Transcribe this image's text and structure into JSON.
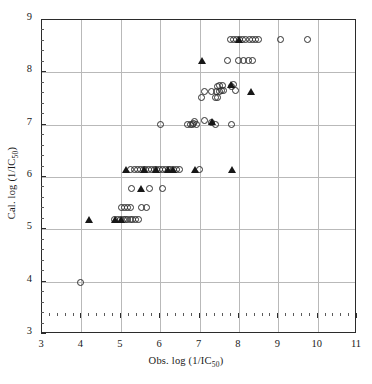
{
  "chart_data": {
    "type": "scatter",
    "title": "",
    "xlabel": "Obs. log (1/IC50)",
    "ylabel": "Cal. log (1/IC50)",
    "xlabel_main": "Obs. log (1/IC",
    "xlabel_sub": "50",
    "xlabel_tail": ")",
    "ylabel_main": "Cal. log (1/IC",
    "ylabel_sub": "50",
    "ylabel_tail": ")",
    "xlim": [
      3,
      11
    ],
    "ylim": [
      3,
      9
    ],
    "xticks": [
      3,
      4,
      5,
      6,
      7,
      8,
      9,
      10,
      11
    ],
    "yticks": [
      3,
      4,
      5,
      6,
      7,
      8,
      9
    ],
    "xtick_labels": [
      "3",
      "4",
      "5",
      "6",
      "7",
      "8",
      "9",
      "10",
      "11"
    ],
    "ytick_labels": [
      "3",
      "4",
      "5",
      "6",
      "7",
      "8",
      "9"
    ],
    "grid": true,
    "legend": "none",
    "minor_ticks_per_interval": 5,
    "series": [
      {
        "name": "training-set",
        "marker": "open-circle",
        "color": "#2f2f2f",
        "points": [
          [
            3.98,
            3.99
          ],
          [
            4.83,
            5.19
          ],
          [
            4.92,
            5.19
          ],
          [
            5.0,
            5.19
          ],
          [
            5.07,
            5.19
          ],
          [
            5.12,
            5.19
          ],
          [
            5.18,
            5.19
          ],
          [
            5.24,
            5.19
          ],
          [
            5.3,
            5.19
          ],
          [
            5.38,
            5.19
          ],
          [
            5.46,
            5.19
          ],
          [
            5.02,
            5.41
          ],
          [
            5.09,
            5.41
          ],
          [
            5.16,
            5.41
          ],
          [
            5.24,
            5.41
          ],
          [
            5.52,
            5.41
          ],
          [
            5.66,
            5.41
          ],
          [
            5.27,
            5.78
          ],
          [
            5.72,
            5.78
          ],
          [
            6.05,
            5.78
          ],
          [
            5.24,
            6.15
          ],
          [
            5.34,
            6.15
          ],
          [
            5.43,
            6.15
          ],
          [
            5.5,
            6.15
          ],
          [
            5.57,
            6.15
          ],
          [
            5.64,
            6.15
          ],
          [
            5.71,
            6.15
          ],
          [
            5.78,
            6.15
          ],
          [
            5.85,
            6.15
          ],
          [
            5.92,
            6.15
          ],
          [
            5.99,
            6.15
          ],
          [
            6.06,
            6.15
          ],
          [
            6.13,
            6.15
          ],
          [
            6.2,
            6.15
          ],
          [
            6.27,
            6.15
          ],
          [
            6.34,
            6.15
          ],
          [
            6.41,
            6.15
          ],
          [
            6.48,
            6.15
          ],
          [
            7.0,
            6.15
          ],
          [
            6.02,
            7.0
          ],
          [
            6.7,
            7.0
          ],
          [
            6.76,
            7.0
          ],
          [
            6.82,
            7.0
          ],
          [
            6.86,
            7.03
          ],
          [
            6.88,
            7.06
          ],
          [
            6.92,
            7.0
          ],
          [
            7.12,
            7.08
          ],
          [
            7.3,
            7.05
          ],
          [
            7.4,
            7.0
          ],
          [
            7.82,
            7.0
          ],
          [
            7.05,
            7.51
          ],
          [
            7.12,
            7.64
          ],
          [
            7.3,
            7.64
          ],
          [
            7.4,
            7.52
          ],
          [
            7.46,
            7.52
          ],
          [
            7.42,
            7.64
          ],
          [
            7.5,
            7.64
          ],
          [
            7.46,
            7.72
          ],
          [
            7.52,
            7.74
          ],
          [
            7.58,
            7.74
          ],
          [
            7.56,
            7.66
          ],
          [
            7.62,
            7.66
          ],
          [
            7.8,
            7.72
          ],
          [
            7.86,
            7.76
          ],
          [
            7.92,
            7.66
          ],
          [
            7.72,
            8.22
          ],
          [
            7.98,
            8.22
          ],
          [
            8.12,
            8.22
          ],
          [
            8.24,
            8.22
          ],
          [
            8.34,
            8.22
          ],
          [
            7.78,
            8.62
          ],
          [
            7.86,
            8.62
          ],
          [
            7.94,
            8.62
          ],
          [
            8.02,
            8.62
          ],
          [
            8.1,
            8.62
          ],
          [
            8.18,
            8.62
          ],
          [
            8.26,
            8.62
          ],
          [
            8.34,
            8.62
          ],
          [
            8.42,
            8.62
          ],
          [
            8.5,
            8.62
          ],
          [
            9.06,
            8.62
          ],
          [
            9.74,
            8.62
          ]
        ]
      },
      {
        "name": "test-set",
        "marker": "filled-triangle",
        "color": "#171717",
        "points": [
          [
            4.2,
            5.19
          ],
          [
            4.86,
            5.19
          ],
          [
            5.0,
            5.19
          ],
          [
            5.52,
            5.78
          ],
          [
            5.14,
            6.15
          ],
          [
            5.6,
            6.15
          ],
          [
            5.9,
            6.15
          ],
          [
            6.2,
            6.15
          ],
          [
            6.32,
            6.15
          ],
          [
            6.88,
            6.15
          ],
          [
            7.82,
            6.15
          ],
          [
            7.32,
            7.06
          ],
          [
            7.8,
            7.76
          ],
          [
            8.3,
            7.64
          ],
          [
            7.06,
            8.22
          ],
          [
            8.0,
            8.62
          ]
        ]
      }
    ]
  }
}
